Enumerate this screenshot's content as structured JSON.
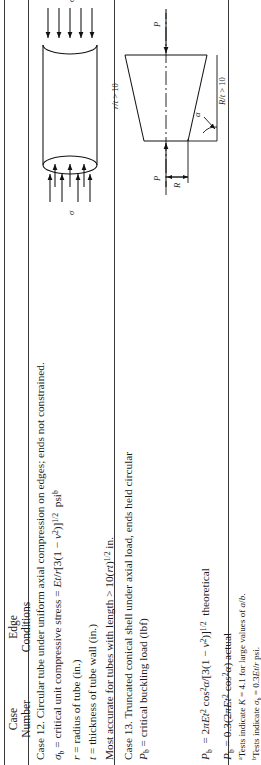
{
  "table": {
    "header": {
      "col1_line1": "Case",
      "col1_line2": "Number",
      "col2_line1": "Edge",
      "col2_line2": "Conditions"
    },
    "rows": [
      {
        "id": "case-12",
        "lines": [
          "Case 12. Circular tube under uniform axial compression on edges; ends not constrained.",
          "σb = critical unit compressive stress = Et/r[3(1 − ν2)]1/2  psib",
          "r = radius of tube (in.)",
          "t = thickness of tube wall (in.)",
          "Most accurate for tubes with length > 10(rt)1/2 in."
        ],
        "figure": {
          "name": "circular-tube-axial-compression",
          "labels": {
            "stress_top": "σ",
            "stress_bottom": "σ",
            "ratio": "r/t > 10"
          }
        }
      },
      {
        "id": "case-13",
        "lines": [
          "Case 13. Truncated conical shell under axial load, ends held circular",
          "Pb = critical buckling load (lbf)"
        ],
        "equations": [
          "Pb  = 2πEt2 cos2α/[3(1 − ν2)]1/2  theoretical",
          "Pb = 0.3(2πEt2 cos2α) actual"
        ],
        "figure": {
          "name": "truncated-conical-shell",
          "labels": {
            "load_left": "P",
            "load_right": "P",
            "radius": "R",
            "angle": "α",
            "ratio": "R/t > 10"
          }
        }
      }
    ],
    "footnotes": [
      "aTests indicate K = 4.1 for large values of a/b.",
      "bTests indicate σb = 0.3Et/r psi."
    ]
  },
  "colors": {
    "rule": "#3a3a3a",
    "ink": "#1a1a1a",
    "figure_stroke": "#111111"
  }
}
